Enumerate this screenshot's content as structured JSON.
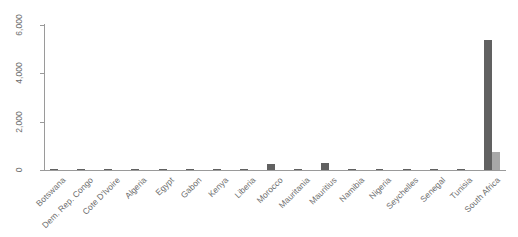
{
  "chart_data": {
    "type": "bar",
    "title": "",
    "subtitle": "",
    "xlabel": "",
    "ylabel": "",
    "ylim": [
      0,
      6500
    ],
    "grid": false,
    "legend_position": "none",
    "orientation": "vertical",
    "categories": [
      "Botswana",
      "Dem. Rep. Congo",
      "Cote D'Ivoire",
      "Algeria",
      "Egypt",
      "Gabon",
      "Kenya",
      "Liberia",
      "Morocco",
      "Mauritania",
      "Mauritius",
      "Namibia",
      "Nigeria",
      "Seychelles",
      "Senegal",
      "Tunisia",
      "South Africa"
    ],
    "series": [
      {
        "name": "series-1",
        "color": "#616161",
        "values": [
          40,
          25,
          20,
          15,
          60,
          10,
          30,
          20,
          250,
          15,
          300,
          25,
          20,
          45,
          15,
          35,
          5380
        ]
      },
      {
        "name": "series-2",
        "color": "#a8a8a8",
        "values": [
          0,
          0,
          0,
          0,
          0,
          0,
          0,
          0,
          0,
          0,
          0,
          0,
          0,
          0,
          0,
          0,
          750
        ]
      }
    ],
    "y_ticks": [
      0,
      2000,
      4000,
      6000
    ],
    "y_tick_labels": [
      "0",
      "2,000",
      "4,000",
      "6,000"
    ]
  },
  "axes": {
    "y_label_0": "0",
    "y_label_1": "2,000",
    "y_label_2": "4,000",
    "y_label_3": "6,000"
  },
  "labels": {
    "c0": "Botswana",
    "c1": "Dem. Rep. Congo",
    "c2": "Cote D'Ivoire",
    "c3": "Algeria",
    "c4": "Egypt",
    "c5": "Gabon",
    "c6": "Kenya",
    "c7": "Liberia",
    "c8": "Morocco",
    "c9": "Mauritania",
    "c10": "Mauritius",
    "c11": "Namibia",
    "c12": "Nigeria",
    "c13": "Seychelles",
    "c14": "Senegal",
    "c15": "Tunisia",
    "c16": "South Africa"
  },
  "colors": {
    "series_1": "#616161",
    "series_2": "#a8a8a8",
    "axis": "#9a9a9a",
    "text": "#6d6d6d",
    "background": "#ffffff"
  }
}
